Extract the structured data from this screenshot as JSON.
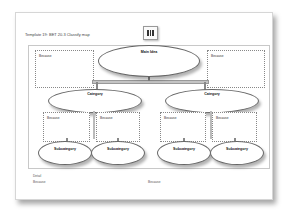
{
  "document": {
    "title": "Template 19: BET 20.3 Classify map",
    "icon": "graphic-organizer-icon"
  },
  "diagram": {
    "main_idea": "Main Idea",
    "top_because": [
      "Because",
      "Because"
    ],
    "categories": [
      {
        "label": "Category",
        "because": [
          "Because",
          "Because"
        ],
        "subcategories": [
          "Subcategory",
          "Subcategory"
        ]
      },
      {
        "label": "Category",
        "because": [
          "Because",
          "Because"
        ],
        "subcategories": [
          "Subcategory",
          "Subcategory"
        ]
      }
    ]
  },
  "footer": {
    "detail_label": "Detail",
    "because_left": "Because",
    "because_right": "Because"
  }
}
